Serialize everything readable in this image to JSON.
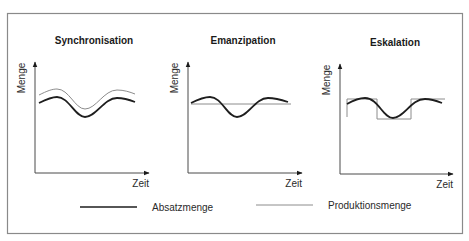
{
  "figure": {
    "frame_color": "#8a8a8a",
    "absatz_color": "#1e1e1e",
    "produktion_color": "#8c8c8c"
  },
  "charts": [
    {
      "title": "Synchronisation",
      "ylabel": "Menge",
      "xlabel": "Zeit",
      "absatz_path": "M39,103 C47,99 52,97 57,97 C69,97 75,117 85,117 C96,117 104,98 117,98 C124,98 130,100 135,102",
      "produktion_path": "M39,95 C47,91 52,89 57,89 C69,89 75,109 85,109 C96,109 104,90 117,90 C124,90 130,92 135,94"
    },
    {
      "title": "Emanzipation",
      "ylabel": "Menge",
      "xlabel": "Zeit",
      "absatz_path": "M191,103 C199,99 204,97 210,97 C222,97 227,117 237,117 C248,117 255,98 268,98 C276,98 282,100 288,102",
      "produktion_path": "M191,104 L291,104"
    },
    {
      "title": "Eskalation",
      "ylabel": "Menge",
      "xlabel": "Zeit",
      "absatz_path": "M347,104 C354,100 359,98 365,98 C378,98 383,118 393,118 C404,118 411,99 425,99 C432,99 437,101 442,103",
      "produktion_path": "M347,117 L347,99 L377,99 L377,119 L411,119 L411,99 L445,99"
    }
  ],
  "legend": {
    "items": [
      {
        "label": "Absatzmenge",
        "style": "thick"
      },
      {
        "label": "Produktionsmenge",
        "style": "thin"
      }
    ]
  }
}
